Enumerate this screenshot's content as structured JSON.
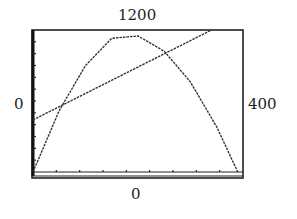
{
  "labels": {
    "ymax": "1200",
    "xmin": "0",
    "xmax": "400",
    "ymin": "0"
  },
  "chart_data": {
    "type": "line",
    "title": "",
    "xlabel": "",
    "ylabel": "",
    "xlim": [
      0,
      400
    ],
    "ylim": [
      0,
      1200
    ],
    "grid": false,
    "tick_marks": {
      "x_count": 8,
      "y_count": 12
    },
    "series": [
      {
        "name": "parabola",
        "x": [
          0,
          50,
          100,
          150,
          200,
          250,
          300,
          350,
          390
        ],
        "y": [
          0,
          520,
          900,
          1130,
          1150,
          1020,
          760,
          380,
          0
        ]
      },
      {
        "name": "line",
        "x": [
          0,
          340
        ],
        "y": [
          440,
          1200
        ]
      }
    ]
  }
}
